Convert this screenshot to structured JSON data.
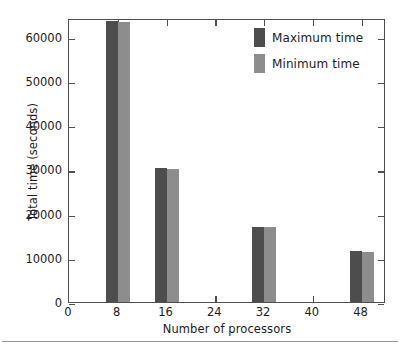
{
  "chart_data": {
    "type": "bar",
    "title": "",
    "xlabel": "Number of processors",
    "ylabel": "Total time (seconds)",
    "categories": [
      8,
      16,
      32,
      48
    ],
    "series": [
      {
        "name": "Maximum time",
        "color": "#4d4d4d",
        "values": [
          63500,
          30200,
          17000,
          11500
        ]
      },
      {
        "name": "Minimum time",
        "color": "#8d8d8d",
        "values": [
          63400,
          30100,
          16900,
          11400
        ]
      }
    ],
    "xlim": [
      0,
      52
    ],
    "ylim": [
      0,
      64200
    ],
    "xticks": [
      0,
      8,
      16,
      24,
      32,
      40,
      48
    ],
    "yticks": [
      0,
      10000,
      20000,
      30000,
      40000,
      50000,
      60000
    ],
    "ytick_labels": [
      "0",
      "10000",
      "20000",
      "30000",
      "40000",
      "50000",
      "60000"
    ],
    "xtick_labels": [
      "0",
      "8",
      "16",
      "24",
      "32",
      "40",
      "48"
    ],
    "grid": false,
    "legend_position": "top-right"
  },
  "legend": {
    "entries": [
      {
        "label": "Maximum time",
        "color": "#4d4d4d"
      },
      {
        "label": "Minimum time",
        "color": "#8d8d8d"
      }
    ]
  },
  "axes": {
    "x_title": "Number of processors",
    "y_title": "Total time (seconds)"
  }
}
